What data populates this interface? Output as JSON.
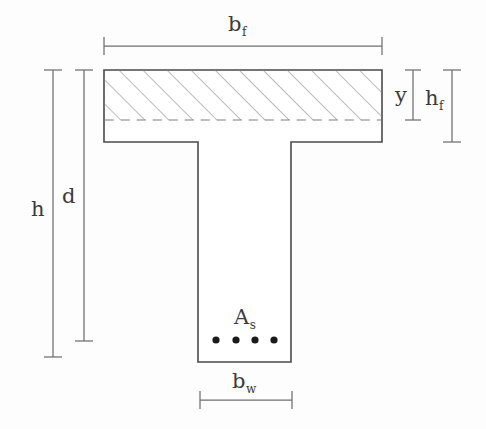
{
  "figure": {
    "labels": {
      "flange_width": {
        "symbol": "b",
        "subscript": "f"
      },
      "web_width": {
        "symbol": "b",
        "subscript": "w"
      },
      "total_height": {
        "symbol": "h",
        "subscript": ""
      },
      "effective_depth": {
        "symbol": "d",
        "subscript": ""
      },
      "compression_block_depth": {
        "symbol": "y",
        "subscript": ""
      },
      "flange_thickness": {
        "symbol": "h",
        "subscript": "f"
      },
      "steel_area": {
        "symbol": "A",
        "subscript": "s"
      }
    },
    "colors": {
      "outline": "#4a4a4a",
      "hatch": "#8c8c8c",
      "dimension_line": "#6f6f6f",
      "rebar": "#1a1a1a",
      "background": "#fdfdfd"
    },
    "geometry": {
      "flange": {
        "x": 104,
        "y": 70,
        "width": 278,
        "height": 72
      },
      "web": {
        "x": 198,
        "y": 142,
        "width": 93,
        "height": 220
      },
      "hatched_zone": {
        "x": 104,
        "y": 70,
        "width": 278,
        "height": 50
      },
      "rebar_diameter": 7,
      "rebar_centers": [
        {
          "x": 216,
          "y": 340
        },
        {
          "x": 236,
          "y": 340
        },
        {
          "x": 255,
          "y": 340
        },
        {
          "x": 274,
          "y": 340
        }
      ]
    },
    "dimensions": [
      {
        "name": "flange-width-dimension",
        "orientation": "horizontal",
        "line_y": 46,
        "from": 104,
        "to": 382,
        "tick_half": 9
      },
      {
        "name": "web-width-dimension",
        "orientation": "horizontal",
        "line_y": 400,
        "from": 200,
        "to": 292,
        "tick_half": 9
      },
      {
        "name": "total-height-dimension",
        "orientation": "vertical",
        "line_x": 53,
        "from": 70,
        "to": 357,
        "tick_half": 9
      },
      {
        "name": "effective-depth-dimension",
        "orientation": "vertical",
        "line_x": 84,
        "from": 70,
        "to": 341,
        "tick_half": 9
      },
      {
        "name": "compression-depth-dimension",
        "orientation": "vertical",
        "line_x": 413,
        "from": 70,
        "to": 120,
        "tick_half": 8
      },
      {
        "name": "flange-thickness-dimension",
        "orientation": "vertical",
        "line_x": 452,
        "from": 70,
        "to": 142,
        "tick_half": 9
      }
    ]
  }
}
